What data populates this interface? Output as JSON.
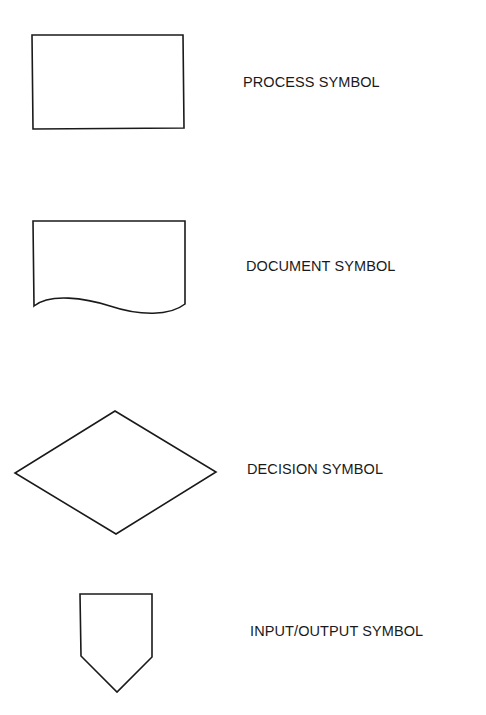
{
  "diagram": {
    "type": "flowchart-symbol-legend",
    "stroke_color": "#1a1a1a",
    "background": "#ffffff",
    "symbols": [
      {
        "id": "process",
        "shape": "rectangle",
        "label": "PROCESS SYMBOL"
      },
      {
        "id": "document",
        "shape": "wavy-bottom-rectangle",
        "label": "DOCUMENT SYMBOL"
      },
      {
        "id": "decision",
        "shape": "diamond",
        "label": "DECISION SYMBOL"
      },
      {
        "id": "input-output",
        "shape": "pentagon-pointing-down",
        "label": "INPUT/OUTPUT SYMBOL"
      }
    ]
  }
}
